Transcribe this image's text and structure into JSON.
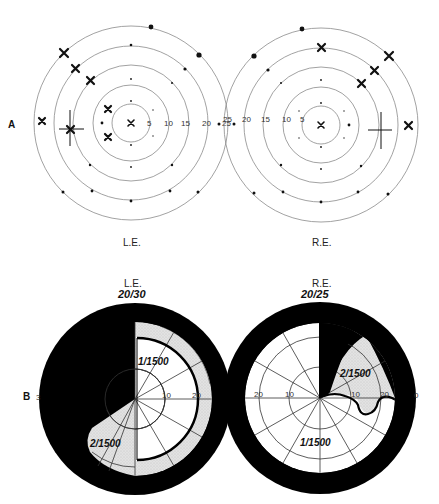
{
  "panel_a": {
    "label": "A",
    "left_eye": {
      "label": "L.E.",
      "ring_labels": [
        "5",
        "10",
        "15",
        "20",
        "25"
      ]
    },
    "right_eye": {
      "label": "R.E.",
      "ring_labels": [
        "5",
        "10",
        "15",
        "20",
        "25"
      ]
    }
  },
  "panel_b": {
    "label": "B",
    "left_eye": {
      "label": "L.E.",
      "acuity": "20/30",
      "isopters": [
        "1/1500",
        "2/1500"
      ],
      "ring_labels": [
        "10",
        "20",
        "3"
      ]
    },
    "right_eye": {
      "label": "R.E.",
      "acuity": "20/25",
      "isopters": [
        "2/1500",
        "1/1500"
      ],
      "ring_labels": [
        "10",
        "20",
        "0"
      ],
      "left_ring_labels": [
        "20",
        "10"
      ]
    }
  },
  "colors": {
    "ink": "#111111",
    "grid": "#888888",
    "scotoma": "#000000",
    "relative_defect": "#d8d8d8",
    "background": "#ffffff"
  }
}
